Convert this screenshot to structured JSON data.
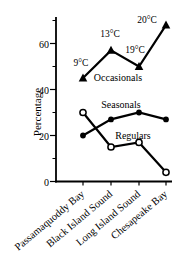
{
  "chart_data": {
    "type": "line",
    "title": "",
    "xlabel": "",
    "ylabel": "Percentage",
    "categories": [
      "Passamaquoddy Bay",
      "Black Island Sound",
      "Long Island Sound",
      "Chesapeake Bay"
    ],
    "series": [
      {
        "name": "Occasionals",
        "marker": "triangle-filled",
        "values": [
          45,
          57,
          50,
          68
        ],
        "point_labels": [
          "9°C",
          "13°C",
          "19°C",
          "20°C"
        ]
      },
      {
        "name": "Seasonals",
        "marker": "circle-filled",
        "values": [
          20,
          27,
          30,
          27
        ],
        "point_labels": []
      },
      {
        "name": "Regulars",
        "marker": "circle-open",
        "values": [
          30,
          15,
          17,
          4
        ],
        "point_labels": []
      }
    ],
    "yticks": [
      0,
      20,
      40,
      60
    ],
    "yticks_minor": [
      10,
      30,
      50,
      70
    ],
    "ylim": [
      0,
      71
    ],
    "grid": false,
    "legend": "inline-labels",
    "colors": {
      "line": "#000000",
      "text": "#000000",
      "background": "#ffffff"
    }
  }
}
